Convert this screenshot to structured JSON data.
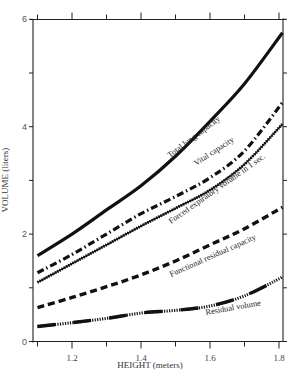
{
  "chart_data": {
    "type": "line",
    "title": "",
    "xlabel": "HEIGHT (meters)",
    "ylabel": "VOLUME (liters)",
    "xlim": [
      1.1,
      1.82
    ],
    "ylim": [
      0,
      6
    ],
    "x_ticks": [
      1.1,
      1.2,
      1.3,
      1.4,
      1.5,
      1.6,
      1.7,
      1.8
    ],
    "x_tick_labels": [
      "",
      "1.2",
      "",
      "1.4",
      "",
      "1.6",
      "",
      "1.8"
    ],
    "y_ticks": [
      0,
      1,
      2,
      3,
      4,
      5,
      6
    ],
    "y_tick_labels": [
      "0",
      "",
      "2",
      "",
      "4",
      "",
      "6"
    ],
    "grid": false,
    "legend": "inline labels along curves",
    "x": [
      1.1,
      1.2,
      1.3,
      1.4,
      1.5,
      1.6,
      1.7,
      1.81
    ],
    "series": [
      {
        "name": "Total lung capacity",
        "style": "solid",
        "values": [
          1.6,
          2.0,
          2.45,
          2.9,
          3.45,
          4.1,
          4.8,
          5.75
        ]
      },
      {
        "name": "Vital capacity",
        "style": "dash-dot",
        "values": [
          1.28,
          1.62,
          2.0,
          2.38,
          2.7,
          3.05,
          3.55,
          4.45
        ]
      },
      {
        "name": "Forced expiratory volume in 1 sec.",
        "style": "hatched",
        "values": [
          1.1,
          1.45,
          1.8,
          2.15,
          2.48,
          2.82,
          3.3,
          4.05
        ]
      },
      {
        "name": "Functional residual capacity",
        "style": "dashed",
        "values": [
          0.63,
          0.82,
          1.02,
          1.24,
          1.5,
          1.8,
          2.1,
          2.5
        ]
      },
      {
        "name": "Residual volume",
        "style": "solid-hatched",
        "values": [
          0.28,
          0.35,
          0.43,
          0.53,
          0.58,
          0.66,
          0.85,
          1.2
        ]
      }
    ]
  },
  "labels": {
    "xlabel": "HEIGHT (meters)",
    "ylabel": "VOLUME (liters)",
    "tlc": "Total lung capacity",
    "vc": "Vital capacity",
    "fev": "Forced expiratory volume in 1 sec.",
    "frc": "Functional residual capacity",
    "rv": "Residual volume"
  }
}
